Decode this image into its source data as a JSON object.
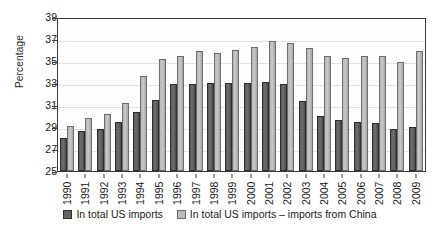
{
  "chart_data": {
    "type": "bar",
    "title": "",
    "xlabel": "",
    "ylabel": "Percentage",
    "ylim": [
      25,
      39
    ],
    "yticks": [
      25,
      27,
      29,
      31,
      33,
      35,
      37,
      39
    ],
    "grid": true,
    "legend_position": "bottom",
    "categories": [
      "1990",
      "1991",
      "1992",
      "1993",
      "1994",
      "1995",
      "1996",
      "1997",
      "1998",
      "1999",
      "2000",
      "2001",
      "2002",
      "2003",
      "2004",
      "2005",
      "2006",
      "2007",
      "2008",
      "2009"
    ],
    "series": [
      {
        "name": "In total US imports",
        "color": "#636363",
        "values": [
          28.0,
          28.6,
          28.8,
          29.5,
          30.4,
          31.5,
          32.9,
          32.9,
          33.0,
          33.0,
          33.0,
          33.1,
          32.9,
          31.4,
          30.0,
          29.6,
          29.5,
          29.4,
          28.8,
          29.0
        ]
      },
      {
        "name": "In total US imports – imports from China",
        "color": "#bdbdbd",
        "values": [
          29.1,
          29.8,
          30.2,
          31.2,
          33.6,
          35.2,
          35.5,
          35.9,
          35.7,
          36.0,
          36.3,
          36.8,
          36.6,
          36.2,
          35.5,
          35.3,
          35.5,
          35.5,
          34.9,
          35.9
        ]
      }
    ]
  },
  "legend": {
    "items": [
      {
        "label": "In total US imports",
        "swatch": "series1-swatch"
      },
      {
        "label": "In total US imports – imports from China",
        "swatch": "series2-swatch"
      }
    ]
  }
}
